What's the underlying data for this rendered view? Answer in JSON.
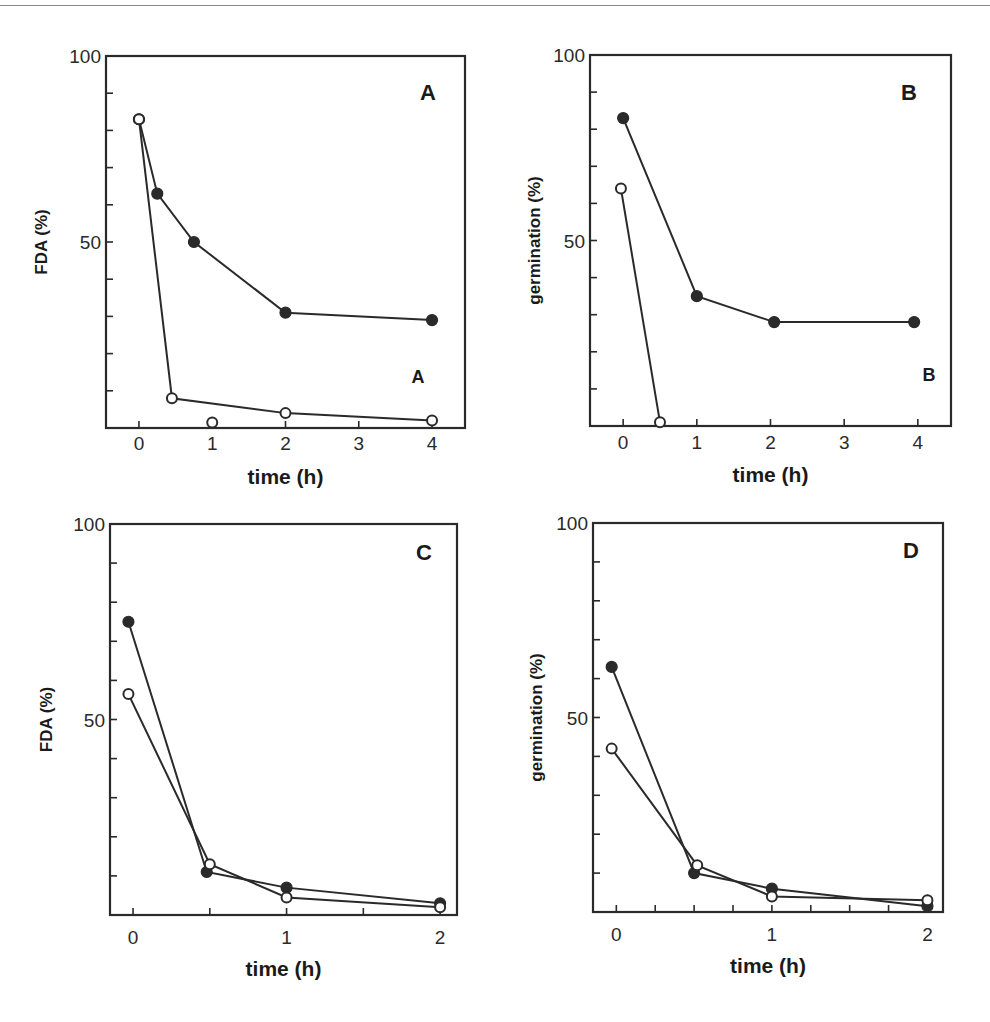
{
  "figure": {
    "line_color": "#2a2a2a",
    "marker_filled_color": "#2a2a2a",
    "marker_open_fill": "#ffffff"
  },
  "chart_data": [
    {
      "panel": "A",
      "type": "line",
      "title": "",
      "panel_label": "A",
      "inner_annotation": "A",
      "xlabel": "time (h)",
      "ylabel": "FDA (%)",
      "xlim": [
        -0.45,
        4.45
      ],
      "ylim": [
        0,
        100
      ],
      "x_ticks": [
        0,
        1,
        2,
        3,
        4
      ],
      "x_tick_labels": [
        "0",
        "1",
        "2",
        "3",
        "4"
      ],
      "y_ticks": [
        10,
        20,
        30,
        40,
        50,
        60,
        70,
        80,
        90,
        100
      ],
      "y_tick_labels": [
        "100",
        "50"
      ],
      "y_labeled_ticks": [
        100,
        50
      ],
      "grid": false,
      "legend": null,
      "series": [
        {
          "name": "filled",
          "marker": "filled-circle",
          "x": [
            0,
            0.25,
            0.75,
            2,
            4
          ],
          "y": [
            83,
            63,
            50,
            31,
            29
          ]
        },
        {
          "name": "open",
          "marker": "open-circle",
          "x": [
            0,
            0.45,
            2,
            4
          ],
          "y": [
            83,
            8,
            4,
            2
          ]
        },
        {
          "name": "open-isolated",
          "marker": "open-circle",
          "x": [
            1
          ],
          "y": [
            1.5
          ],
          "connected": false
        }
      ]
    },
    {
      "panel": "B",
      "type": "line",
      "title": "",
      "panel_label": "B",
      "inner_annotation": "B",
      "xlabel": "time (h)",
      "ylabel": "germination (%)",
      "xlim": [
        -0.45,
        4.45
      ],
      "ylim": [
        0,
        100
      ],
      "x_ticks": [
        0,
        1,
        2,
        3,
        4
      ],
      "x_tick_labels": [
        "0",
        "1",
        "2",
        "3",
        "4"
      ],
      "y_ticks": [
        10,
        20,
        30,
        40,
        50,
        60,
        70,
        80,
        90,
        100
      ],
      "y_tick_labels": [
        "100",
        "50"
      ],
      "y_labeled_ticks": [
        100,
        50
      ],
      "grid": false,
      "legend": null,
      "series": [
        {
          "name": "filled",
          "marker": "filled-circle",
          "x": [
            0,
            1,
            2.05,
            3.95
          ],
          "y": [
            83,
            35,
            28,
            28
          ]
        },
        {
          "name": "open",
          "marker": "open-circle",
          "x": [
            -0.03,
            0.5
          ],
          "y": [
            64,
            1
          ]
        }
      ]
    },
    {
      "panel": "C",
      "type": "line",
      "title": "",
      "panel_label": "C",
      "xlabel": "time (h)",
      "ylabel": "FDA (%)",
      "xlim": [
        -0.15,
        2.11
      ],
      "ylim": [
        0,
        100
      ],
      "x_ticks": [
        0,
        0.5,
        1,
        1.5,
        2
      ],
      "x_tick_labels": [
        "0",
        "1",
        "2"
      ],
      "x_labeled_ticks": [
        0,
        1,
        2
      ],
      "y_ticks": [
        10,
        20,
        30,
        40,
        50,
        60,
        70,
        80,
        90,
        100
      ],
      "y_tick_labels": [
        "100",
        "50"
      ],
      "y_labeled_ticks": [
        100,
        50
      ],
      "grid": false,
      "legend": null,
      "series": [
        {
          "name": "filled",
          "marker": "filled-circle",
          "x": [
            -0.03,
            0.48,
            1,
            2
          ],
          "y": [
            75,
            11,
            7,
            3
          ]
        },
        {
          "name": "open",
          "marker": "open-circle",
          "x": [
            -0.03,
            0.5,
            1,
            2
          ],
          "y": [
            56.5,
            13,
            4.5,
            2
          ]
        }
      ]
    },
    {
      "panel": "D",
      "type": "line",
      "title": "",
      "panel_label": "D",
      "xlabel": "time (h)",
      "ylabel": "germination (%)",
      "xlim": [
        -0.15,
        2.1
      ],
      "ylim": [
        0,
        100
      ],
      "x_ticks": [
        0,
        0.25,
        0.5,
        0.75,
        1,
        1.25,
        1.5,
        1.75,
        2
      ],
      "x_tick_labels": [
        "0",
        "1",
        "2"
      ],
      "x_labeled_ticks": [
        0,
        1,
        2
      ],
      "y_ticks": [
        10,
        20,
        30,
        40,
        50,
        60,
        70,
        80,
        90,
        100
      ],
      "y_tick_labels": [
        "100",
        "50"
      ],
      "y_labeled_ticks": [
        100,
        50
      ],
      "grid": false,
      "legend": null,
      "series": [
        {
          "name": "filled",
          "marker": "filled-circle",
          "x": [
            -0.03,
            0.5,
            1,
            2
          ],
          "y": [
            63,
            10,
            6,
            1.5
          ]
        },
        {
          "name": "open",
          "marker": "open-circle",
          "x": [
            -0.03,
            0.52,
            1,
            2
          ],
          "y": [
            42,
            12,
            4,
            3
          ]
        }
      ]
    }
  ],
  "layout": [
    {
      "panel": "A",
      "left": 106,
      "top": 56,
      "right": 465,
      "bottom": 428,
      "ylabel_x": 47,
      "label_font": 17,
      "letter": [
        428,
        100
      ],
      "letter_size": 22,
      "annot": [
        418,
        383
      ],
      "annot_size": 18,
      "xtitle_y": 484,
      "tick_label_y": 450
    },
    {
      "panel": "B",
      "left": 590,
      "top": 55,
      "right": 951,
      "bottom": 426,
      "ylabel_x": 540,
      "label_font": 17,
      "letter": [
        909,
        100
      ],
      "letter_size": 22,
      "annot": [
        929,
        381
      ],
      "annot_size": 18,
      "xtitle_y": 482,
      "tick_label_y": 449
    },
    {
      "panel": "C",
      "left": 110,
      "top": 524,
      "right": 457,
      "bottom": 915,
      "ylabel_x": 52,
      "label_font": 17,
      "letter": [
        424,
        560
      ],
      "letter_size": 22,
      "annot": null,
      "annot_size": 0,
      "xtitle_y": 976,
      "tick_label_y": 944
    },
    {
      "panel": "D",
      "left": 593,
      "top": 523,
      "right": 943,
      "bottom": 912,
      "ylabel_x": 542,
      "label_font": 17,
      "letter": [
        911,
        558
      ],
      "letter_size": 22,
      "annot": null,
      "annot_size": 0,
      "xtitle_y": 973,
      "tick_label_y": 941
    }
  ]
}
